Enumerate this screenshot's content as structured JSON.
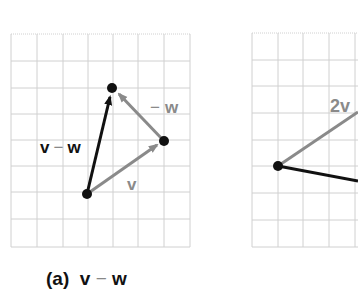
{
  "colors": {
    "grid": "#d0d0d0",
    "black_vector": "#111111",
    "gray_vector": "#8a8a8a",
    "background": "#ffffff"
  },
  "panel_a": {
    "caption": {
      "prefix": "(a)",
      "v": "v",
      "minus": "−",
      "w": "w"
    },
    "labels": {
      "v_minus_w": {
        "v": "v",
        "minus": "−",
        "w": "w"
      },
      "neg_w": {
        "minus": "−",
        "w": "w"
      },
      "v": "v"
    },
    "points": {
      "origin": [
        87,
        194
      ],
      "v_tip": [
        164,
        141
      ],
      "top": [
        112,
        88
      ]
    },
    "vectors": [
      {
        "name": "v",
        "from": "origin",
        "to": "v_tip",
        "color": "gray"
      },
      {
        "name": "-w",
        "from": "v_tip",
        "to": "top",
        "color": "gray"
      },
      {
        "name": "v - w",
        "from": "origin",
        "to": "top",
        "color": "black"
      }
    ]
  },
  "panel_b": {
    "labels": {
      "two_v": "2v"
    },
    "points": {
      "origin": [
        278,
        166
      ]
    }
  }
}
